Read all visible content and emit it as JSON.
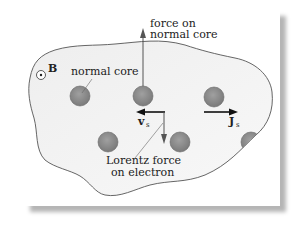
{
  "diagram": {
    "labels": {
      "field": "B",
      "normal_core": "normal core",
      "force_on_core_line1": "force on",
      "force_on_core_line2": "normal core",
      "velocity": "v",
      "velocity_sub": "s",
      "current": "J",
      "current_sub": "s",
      "lorentz_line1": "Lorentz force",
      "lorentz_line2": "on electron"
    },
    "colors": {
      "core_fill": "#8a8a8a",
      "boundary_fill": "#f1f1f1",
      "outline": "#555555",
      "arrow": "#333333",
      "card_shadow": "#b5b5b5"
    },
    "cores": [
      {
        "cx": 80,
        "cy": 96
      },
      {
        "cx": 143,
        "cy": 96
      },
      {
        "cx": 214,
        "cy": 97
      },
      {
        "cx": 108,
        "cy": 143
      },
      {
        "cx": 179,
        "cy": 142
      }
    ]
  }
}
